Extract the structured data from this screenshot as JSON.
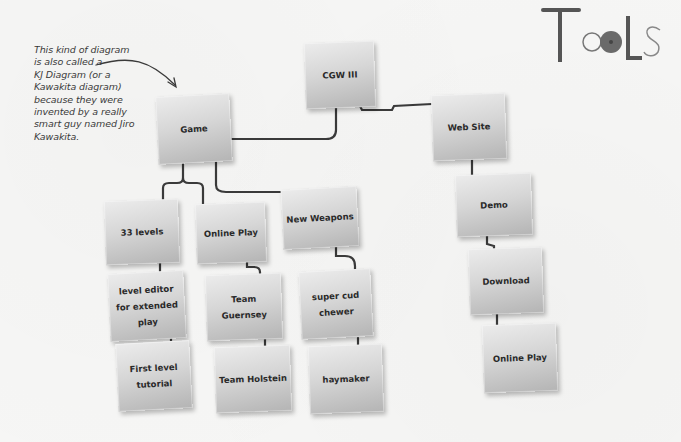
{
  "logo": {
    "text": "Tools",
    "icon": "tools-logo-icon"
  },
  "annotation": {
    "lines": [
      "This kind of diagram",
      "is also called a",
      "KJ Diagram (or a",
      "Kawakita diagram)",
      "because they were",
      "invented by a really",
      "smart guy named Jiro",
      "Kawakita."
    ],
    "arrow_icon": "curved-arrow-icon"
  },
  "diagram": {
    "root": {
      "label": "CGW III"
    },
    "nodes": {
      "game": "Game",
      "website": "Web Site",
      "levels": "33 levels",
      "online_play_game": "Online Play",
      "new_weapons": "New Weapons",
      "level_editor": "level editor for extended play",
      "team_guernsey": "Team Guernsey",
      "super_cud": "super cud chewer",
      "first_level": "First level tutorial",
      "team_holstein": "Team Holstein",
      "haymaker": "haymaker",
      "demo": "Demo",
      "download": "Download",
      "online_play_web": "Online Play"
    }
  },
  "colors": {
    "background": "#f6f6f5",
    "node_top": "#ececec",
    "node_bottom": "#b4b4b4",
    "connector": "#3a3a3a",
    "text": "#2a2a2a"
  }
}
